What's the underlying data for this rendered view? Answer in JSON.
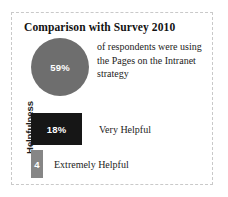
{
  "card": {
    "title": "Comparison with Survey 2010",
    "border_color": "#c9c9c9",
    "background": "#ffffff"
  },
  "circle_stat": {
    "value_label": "59%",
    "caption": "of respondents were using the Pages on the Intranet strategy",
    "color": "#6e6e6e",
    "value_color": "#ffffff"
  },
  "bars": {
    "axis_label": "Helpfulness",
    "items": [
      {
        "value_label": "18%",
        "category": "Very Helpful",
        "color": "#161616"
      },
      {
        "value_label": "4",
        "category": "Extremely Helpful",
        "color": "#868686"
      }
    ]
  },
  "chart_data": {
    "type": "bar",
    "title": "Comparison with Survey 2010",
    "xlabel": "",
    "ylabel": "Helpfulness",
    "categories": [
      "Very Helpful",
      "Extremely Helpful"
    ],
    "values": [
      18,
      4
    ],
    "value_labels": [
      "18%",
      "4"
    ],
    "grid": false,
    "legend": "none",
    "orientation": "horizontal",
    "colors": [
      "#161616",
      "#868686"
    ],
    "annotations": [
      {
        "type": "circle-stat",
        "value": 59,
        "value_label": "59%",
        "text": "of respondents were using the Pages on the Intranet strategy",
        "color": "#6e6e6e"
      }
    ]
  }
}
